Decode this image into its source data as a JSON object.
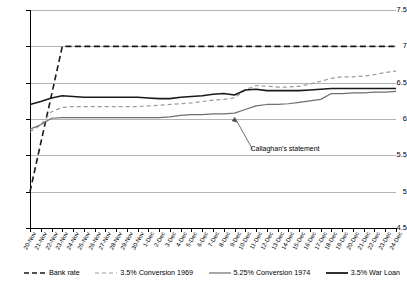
{
  "chart_data": {
    "type": "line",
    "title": "",
    "subtitle": "",
    "xlabel": "",
    "ylabel": "",
    "ylim": [
      4.5,
      7.5
    ],
    "ytick_step": 0.5,
    "yticks": [
      "4.5",
      "5",
      "5.5",
      "6",
      "6.5",
      "7",
      "7.5"
    ],
    "grid": true,
    "legend_position": "bottom",
    "categories": [
      "20-Nov",
      "21-Nov",
      "22-Nov",
      "23-Nov",
      "24-Nov",
      "25-Nov",
      "26-Nov",
      "27-Nov",
      "28-Nov",
      "29-Nov",
      "30-Nov",
      "1-Dec",
      "2-Dec",
      "3-Dec",
      "4-Dec",
      "5-Dec",
      "6-Dec",
      "7-Dec",
      "8-Dec",
      "9-Dec",
      "10-Dec",
      "11-Dec",
      "12-Dec",
      "13-Dec",
      "14-Dec",
      "15-Dec",
      "16-Dec",
      "17-Dec",
      "18-Dec",
      "19-Dec",
      "20-Dec",
      "21-Dec",
      "22-Dec",
      "23-Dec",
      "24-Dec"
    ],
    "series": [
      {
        "name": "Bank rate",
        "color": "#1a1a1a",
        "style": "dashed",
        "width": 1.6,
        "values": [
          5.0,
          5.67,
          6.33,
          7.0,
          7.0,
          7.0,
          7.0,
          7.0,
          7.0,
          7.0,
          7.0,
          7.0,
          7.0,
          7.0,
          7.0,
          7.0,
          7.0,
          7.0,
          7.0,
          7.0,
          7.0,
          7.0,
          7.0,
          7.0,
          7.0,
          7.0,
          7.0,
          7.0,
          7.0,
          7.0,
          7.0,
          7.0,
          7.0,
          7.0,
          7.0
        ]
      },
      {
        "name": "3.5% Conversion 1969",
        "color": "#9a9a9a",
        "style": "dashed",
        "width": 1.2,
        "values": [
          5.82,
          5.92,
          6.1,
          6.16,
          6.17,
          6.17,
          6.17,
          6.17,
          6.17,
          6.17,
          6.17,
          6.18,
          6.19,
          6.2,
          6.21,
          6.22,
          6.24,
          6.26,
          6.27,
          6.29,
          6.4,
          6.46,
          6.45,
          6.44,
          6.44,
          6.45,
          6.48,
          6.52,
          6.56,
          6.58,
          6.58,
          6.59,
          6.61,
          6.64,
          6.66
        ]
      },
      {
        "name": "5.25% Conversion 1974",
        "color": "#6e6e6e",
        "style": "solid",
        "width": 1.2,
        "values": [
          5.86,
          5.92,
          6.01,
          6.02,
          6.02,
          6.02,
          6.02,
          6.02,
          6.02,
          6.02,
          6.02,
          6.02,
          6.02,
          6.03,
          6.05,
          6.06,
          6.06,
          6.07,
          6.07,
          6.08,
          6.13,
          6.18,
          6.2,
          6.2,
          6.21,
          6.23,
          6.25,
          6.27,
          6.35,
          6.35,
          6.36,
          6.36,
          6.37,
          6.37,
          6.38
        ]
      },
      {
        "name": "3.5% War Loan",
        "color": "#1a1a1a",
        "style": "solid",
        "width": 1.6,
        "values": [
          6.2,
          6.24,
          6.29,
          6.32,
          6.31,
          6.3,
          6.3,
          6.3,
          6.3,
          6.3,
          6.3,
          6.29,
          6.28,
          6.28,
          6.3,
          6.31,
          6.32,
          6.34,
          6.35,
          6.33,
          6.4,
          6.41,
          6.39,
          6.39,
          6.39,
          6.39,
          6.4,
          6.41,
          6.42,
          6.42,
          6.42,
          6.42,
          6.42,
          6.42,
          6.42
        ]
      }
    ],
    "annotations": [
      {
        "text": "Callaghan's statement",
        "target_category": "9-Dec",
        "target_value": 6.08
      }
    ]
  },
  "legend": {
    "items": [
      {
        "label": "Bank rate"
      },
      {
        "label": "3.5% Conversion 1969"
      },
      {
        "label": "5.25% Conversion 1974"
      },
      {
        "label": "3.5% War Loan"
      }
    ]
  }
}
